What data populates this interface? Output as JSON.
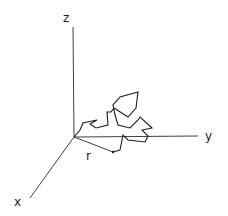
{
  "diagram": {
    "type": "3d-coordinate-random-walk",
    "labels": {
      "z_axis": "z",
      "y_axis": "y",
      "x_axis": "x",
      "displacement": "r"
    },
    "origin": [
      74,
      137
    ],
    "axes": {
      "z": {
        "from": [
          74,
          137
        ],
        "to": [
          73,
          27
        ]
      },
      "y": {
        "from": [
          74,
          137
        ],
        "to": [
          198,
          136
        ]
      },
      "x": {
        "from": [
          74,
          137
        ],
        "to": [
          30,
          198
        ]
      }
    },
    "displacement_vector": {
      "from": [
        74,
        137
      ],
      "to": [
        113,
        152
      ]
    },
    "walk_path": [
      [
        74,
        137
      ],
      [
        80,
        130
      ],
      [
        83,
        123
      ],
      [
        97,
        120
      ],
      [
        90,
        124
      ],
      [
        96,
        128
      ],
      [
        108,
        125
      ],
      [
        107,
        112
      ],
      [
        111,
        112
      ],
      [
        114,
        108
      ],
      [
        128,
        117
      ],
      [
        136,
        108
      ],
      [
        138,
        92
      ],
      [
        120,
        97
      ],
      [
        113,
        105
      ],
      [
        115,
        115
      ],
      [
        118,
        125
      ],
      [
        130,
        128
      ],
      [
        138,
        120
      ],
      [
        140,
        117
      ],
      [
        152,
        128
      ],
      [
        142,
        130
      ],
      [
        148,
        136
      ],
      [
        145,
        142
      ],
      [
        128,
        140
      ],
      [
        123,
        135
      ],
      [
        120,
        150
      ],
      [
        113,
        152
      ]
    ],
    "colors": {
      "line": "#1e1e1e",
      "background": "#ffffff"
    }
  }
}
